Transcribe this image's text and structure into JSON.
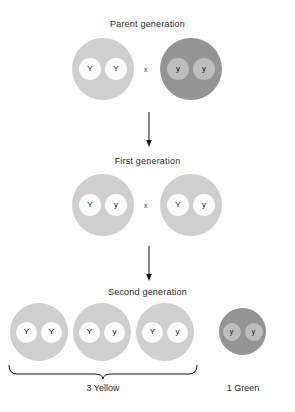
{
  "diagram": {
    "colors": {
      "yellow_organism": "#cfcfcf",
      "green_organism": "#949494",
      "yellow_allele": "#fbfbfb",
      "green_allele": "#bdbdbd",
      "text": "#2a2a2a",
      "line": "#111111",
      "background": "#ffffff"
    },
    "cross_symbol": "x",
    "generations": [
      {
        "id": "parent",
        "label": "Parent generation",
        "organisms": [
          {
            "id": "parent-1",
            "phenotype": "yellow",
            "alleles": [
              "Y",
              "Y"
            ]
          },
          {
            "id": "parent-2",
            "phenotype": "green",
            "alleles": [
              "y",
              "y"
            ]
          }
        ]
      },
      {
        "id": "first",
        "label": "First generation",
        "organisms": [
          {
            "id": "first-1",
            "phenotype": "yellow",
            "alleles": [
              "Y",
              "y"
            ]
          },
          {
            "id": "first-2",
            "phenotype": "yellow",
            "alleles": [
              "Y",
              "y"
            ]
          }
        ]
      },
      {
        "id": "second",
        "label": "Second generation",
        "organisms": [
          {
            "id": "second-1",
            "phenotype": "yellow",
            "alleles": [
              "Y",
              "Y"
            ]
          },
          {
            "id": "second-2",
            "phenotype": "yellow",
            "alleles": [
              "Y",
              "y"
            ]
          },
          {
            "id": "second-3",
            "phenotype": "yellow",
            "alleles": [
              "Y",
              "y"
            ]
          },
          {
            "id": "second-4",
            "phenotype": "green",
            "alleles": [
              "y",
              "y"
            ]
          }
        ]
      }
    ],
    "ratio_labels": {
      "yellow": "3 Yellow",
      "green": "1 Green"
    }
  }
}
